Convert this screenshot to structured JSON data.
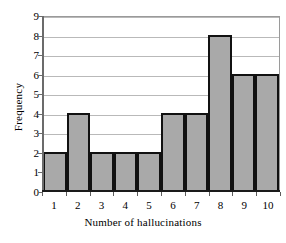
{
  "chart_data": {
    "type": "bar",
    "title": "",
    "subtitle": "",
    "xlabel": "Number of hallucinations",
    "ylabel": "Frequency",
    "categories": [
      "1",
      "2",
      "3",
      "4",
      "5",
      "6",
      "7",
      "8",
      "9",
      "10"
    ],
    "values": [
      2,
      4,
      2,
      2,
      2,
      4,
      4,
      8,
      6,
      6
    ],
    "ylim": [
      0,
      9
    ],
    "xlim": [
      0,
      10
    ],
    "y_ticks": [
      "0",
      "1",
      "2",
      "3",
      "4",
      "5",
      "6",
      "7",
      "8",
      "9"
    ],
    "y_tick_values": [
      0,
      1,
      2,
      3,
      4,
      5,
      6,
      7,
      8,
      9
    ],
    "grid": "horizontal",
    "legend": "none",
    "annotations": [],
    "colors": {
      "bar_fill": "#a9a9a9",
      "bar_border": "#111111",
      "gridline": "#b9b9b9",
      "axis": "#5c5c5c",
      "plot_background": "#ffffff",
      "plot_border": "#9a9a9a",
      "text": "#000000"
    }
  }
}
